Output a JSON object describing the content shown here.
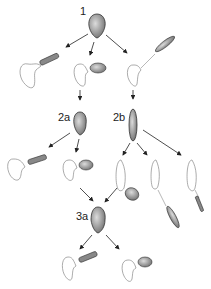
{
  "diagram": {
    "type": "lineage-tree",
    "nodes": [
      {
        "id": "1",
        "label": "1"
      },
      {
        "id": "2a",
        "label": "2a"
      },
      {
        "id": "2b",
        "label": "2b"
      },
      {
        "id": "3a",
        "label": "3a"
      }
    ],
    "colors": {
      "stroke": "#333333",
      "fill_dark": "#777777",
      "fill_light": "#bbbbbb",
      "outline": "#999999"
    }
  }
}
